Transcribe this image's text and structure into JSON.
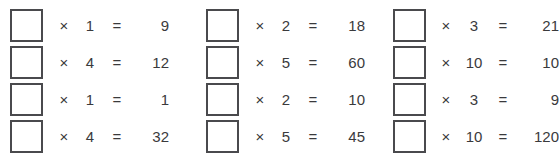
{
  "worksheet": {
    "symbols": {
      "times": "×",
      "equals": "="
    },
    "columns": [
      {
        "rows": [
          {
            "box_value": "",
            "times": "×",
            "multiplier": "1",
            "equals": "=",
            "result": "9"
          },
          {
            "box_value": "",
            "times": "×",
            "multiplier": "4",
            "equals": "=",
            "result": "12"
          },
          {
            "box_value": "",
            "times": "×",
            "multiplier": "1",
            "equals": "=",
            "result": "1"
          },
          {
            "box_value": "",
            "times": "×",
            "multiplier": "4",
            "equals": "=",
            "result": "32"
          }
        ]
      },
      {
        "rows": [
          {
            "box_value": "",
            "times": "×",
            "multiplier": "2",
            "equals": "=",
            "result": "18"
          },
          {
            "box_value": "",
            "times": "×",
            "multiplier": "5",
            "equals": "=",
            "result": "60"
          },
          {
            "box_value": "",
            "times": "×",
            "multiplier": "2",
            "equals": "=",
            "result": "10"
          },
          {
            "box_value": "",
            "times": "×",
            "multiplier": "5",
            "equals": "=",
            "result": "45"
          }
        ]
      },
      {
        "rows": [
          {
            "box_value": "",
            "times": "×",
            "multiplier": "3",
            "equals": "=",
            "result": "21"
          },
          {
            "box_value": "",
            "times": "×",
            "multiplier": "10",
            "equals": "=",
            "result": "10"
          },
          {
            "box_value": "",
            "times": "×",
            "multiplier": "3",
            "equals": "=",
            "result": "9"
          },
          {
            "box_value": "",
            "times": "×",
            "multiplier": "10",
            "equals": "=",
            "result": "120"
          }
        ]
      }
    ],
    "colors": {
      "box_border": "#4a4a4d",
      "text": "#3a3a3c",
      "background": "#ffffff"
    }
  }
}
